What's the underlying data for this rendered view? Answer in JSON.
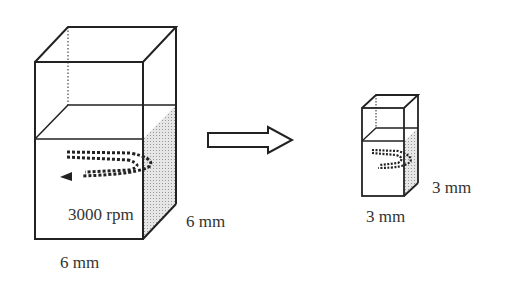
{
  "large_box": {
    "speed_label": "3000 rpm",
    "width_label": "6 mm",
    "depth_label": "6 mm"
  },
  "small_box": {
    "width_label": "3 mm",
    "depth_label": "3 mm"
  },
  "arrow": {
    "direction": "right"
  },
  "colors": {
    "stroke": "#222222",
    "shade": "#cfcfcf"
  }
}
